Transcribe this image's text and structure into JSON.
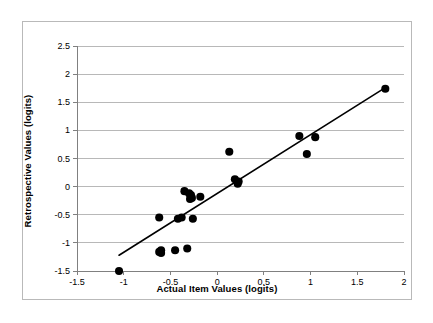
{
  "chart_data": {
    "type": "scatter",
    "title": "",
    "xlabel": "Actual Item Values (logits)",
    "ylabel": "Retrospective Values (logits)",
    "xlim": [
      -1.5,
      2
    ],
    "ylim": [
      -1.5,
      2.5
    ],
    "xticks": [
      "-1.5",
      "-1",
      "-0.5",
      "0",
      "0.5",
      "1",
      "1.5",
      "2"
    ],
    "xtick_values": [
      -1.5,
      -1,
      -0.5,
      0,
      0.5,
      1,
      1.5,
      2
    ],
    "yticks": [
      "-1.5",
      "-1",
      "-0.5",
      "0",
      "0.5",
      "1",
      "1.5",
      "2",
      "2.5"
    ],
    "ytick_values": [
      -1.5,
      -1,
      -0.5,
      0,
      0.5,
      1,
      1.5,
      2,
      2.5
    ],
    "grid": "horizontal",
    "grid_color": "#a6a6a6",
    "legend": "none",
    "marker_color": "#000000",
    "marker_shape": "circle",
    "marker_size": 5.5,
    "series": [
      {
        "name": "items",
        "points": [
          [
            -1.05,
            -1.5
          ],
          [
            -0.62,
            -0.55
          ],
          [
            -0.62,
            -1.16
          ],
          [
            -0.6,
            -1.13
          ],
          [
            -0.6,
            -1.18
          ],
          [
            -0.45,
            -1.13
          ],
          [
            -0.42,
            -0.57
          ],
          [
            -0.38,
            -0.55
          ],
          [
            -0.35,
            -0.08
          ],
          [
            -0.32,
            -1.1
          ],
          [
            -0.3,
            -0.12
          ],
          [
            -0.29,
            -0.22
          ],
          [
            -0.28,
            -0.15
          ],
          [
            -0.27,
            -0.2
          ],
          [
            -0.26,
            -0.57
          ],
          [
            -0.18,
            -0.18
          ],
          [
            0.13,
            0.62
          ],
          [
            0.19,
            0.13
          ],
          [
            0.22,
            0.05
          ],
          [
            0.23,
            0.09
          ],
          [
            0.88,
            0.9
          ],
          [
            0.96,
            0.58
          ],
          [
            1.05,
            0.88
          ],
          [
            1.8,
            1.74
          ]
        ]
      }
    ],
    "trendline": {
      "type": "line",
      "color": "#000000",
      "width": 1.6,
      "x_start": -1.05,
      "y_start": -1.22,
      "x_end": 1.8,
      "y_end": 1.76
    }
  },
  "figure": {
    "frame_color": "#b9b9b9",
    "background": "#ffffff",
    "axis_color": "#808080"
  }
}
